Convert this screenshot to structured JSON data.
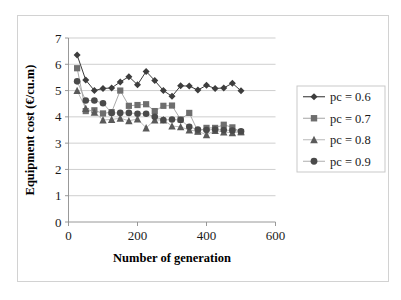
{
  "chart_data": {
    "type": "line",
    "title": "",
    "xlabel": "Number of generation",
    "ylabel": "Equipment cost (€/cu.m)",
    "xlim": [
      0,
      600
    ],
    "ylim": [
      0,
      7
    ],
    "xticks": [
      0,
      200,
      400,
      600
    ],
    "yticks": [
      0,
      1,
      2,
      3,
      4,
      5,
      6,
      7
    ],
    "xtick_labels": [
      "0",
      "200",
      "400",
      "600"
    ],
    "ytick_labels": [
      "0",
      "1",
      "2",
      "3",
      "4",
      "5",
      "6",
      "7"
    ],
    "grid": "horizontal",
    "legend_position": "right",
    "series": [
      {
        "name": "pc = 0.6",
        "marker": "diamond",
        "color": "#3d3d3d",
        "line_color": "#3d3d3d",
        "x": [
          25,
          50,
          75,
          100,
          125,
          150,
          175,
          200,
          225,
          250,
          275,
          300,
          325,
          350,
          375,
          400,
          425,
          450,
          475,
          500
        ],
        "y": [
          6.35,
          5.4,
          5.0,
          5.08,
          5.1,
          5.33,
          5.53,
          5.22,
          5.73,
          5.38,
          5.0,
          4.78,
          5.18,
          5.17,
          5.02,
          5.2,
          5.08,
          5.1,
          5.28,
          4.99
        ]
      },
      {
        "name": "pc = 0.7",
        "marker": "square",
        "color": "#6e6e6e",
        "line_color": "#9a9a9a",
        "x": [
          25,
          50,
          75,
          100,
          125,
          150,
          175,
          200,
          225,
          250,
          275,
          300,
          325,
          350,
          375,
          400,
          425,
          450,
          475,
          500
        ],
        "y": [
          5.85,
          4.22,
          4.25,
          4.13,
          4.18,
          5.0,
          4.42,
          4.45,
          4.48,
          4.22,
          4.42,
          4.43,
          3.9,
          4.15,
          3.45,
          3.58,
          3.58,
          3.7,
          3.6,
          3.42
        ]
      },
      {
        "name": "pc = 0.8",
        "marker": "triangle",
        "color": "#5a5a5a",
        "line_color": "#b0b0b0",
        "x": [
          25,
          50,
          75,
          100,
          125,
          150,
          175,
          200,
          225,
          250,
          275,
          300,
          325,
          350,
          375,
          400,
          425,
          450,
          475,
          500
        ],
        "y": [
          5.0,
          4.32,
          4.18,
          3.88,
          3.9,
          3.95,
          3.85,
          3.92,
          3.58,
          3.88,
          3.88,
          3.65,
          3.62,
          3.5,
          3.45,
          3.32,
          3.48,
          3.42,
          3.4,
          3.43
        ]
      },
      {
        "name": "pc = 0.9",
        "marker": "circle",
        "color": "#4a4a4a",
        "line_color": "#a5a5a5",
        "x": [
          25,
          50,
          75,
          100,
          125,
          150,
          175,
          200,
          225,
          250,
          275,
          300,
          325,
          350,
          375,
          400,
          425,
          450,
          475,
          500
        ],
        "y": [
          5.35,
          4.62,
          4.62,
          4.52,
          4.15,
          4.15,
          4.15,
          4.12,
          4.12,
          4.0,
          3.88,
          3.9,
          3.88,
          3.62,
          3.52,
          3.5,
          3.52,
          3.5,
          3.48,
          3.45
        ]
      }
    ]
  },
  "legend": {
    "items": [
      {
        "label": "pc = 0.6"
      },
      {
        "label": "pc = 0.7"
      },
      {
        "label": "pc = 0.8"
      },
      {
        "label": "pc = 0.9"
      }
    ]
  }
}
